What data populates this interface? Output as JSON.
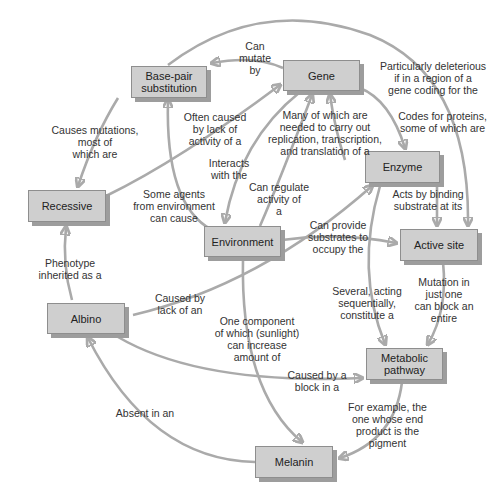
{
  "diagram": {
    "type": "concept-map",
    "colors": {
      "node_fill": "#cfcfcf",
      "node_border": "#8e8e8e",
      "node_shadow": "#9d9d9d",
      "edge": "#aaaaaa",
      "text": "#2a2a2a"
    },
    "nodes": {
      "base_pair": "Base-pair substitution",
      "gene": "Gene",
      "enzyme": "Enzyme",
      "recessive": "Recessive",
      "environment": "Environment",
      "active_site": "Active site",
      "albino": "Albino",
      "metabolic": "Metabolic pathway",
      "melanin": "Melanin"
    },
    "edges": {
      "gene_to_base_pair": "Can\nmutate\nby",
      "base_pair_to_recessive": "Causes mutations,\nmost of\nwhich are",
      "enzyme_to_base_pair": "Often caused\nby lack of\nactivity of a",
      "gene_top_arc": "Particularly deleterious\nif in a region of a\ngene coding for the",
      "gene_to_enzyme": "Codes for proteins,\nsome of which are",
      "enzyme_to_gene": "Many of which are\nneeded to carry out\nreplication, transcription,\nand translation of a",
      "gene_to_environment": "Interacts\nwith the",
      "environment_to_base_pair": "Some agents\nfrom environment\ncan cause",
      "environment_to_gene": "Can regulate\nactivity of\na",
      "enzyme_to_active_site": "Acts by binding\nsubstrate at its",
      "environment_to_active_site": "Can provide\nsubstrates to\noccupy the",
      "albino_to_recessive": "Phenotype\ninherited as a",
      "albino_to_enzyme": "Caused by\nlack of an",
      "enzyme_to_metabolic": "Several, acting\nsequentially,\nconstitute a",
      "active_site_to_metabolic": "Mutation in\njust one\ncan block an\nentire",
      "environment_to_melanin": "One component\nof which (sunlight)\ncan increase\namount of",
      "albino_to_metabolic": "Caused by a\nblock in a",
      "metabolic_to_melanin": "For example, the\none whose end\nproduct is the\npigment",
      "melanin_to_albino": "Absent in an"
    }
  }
}
